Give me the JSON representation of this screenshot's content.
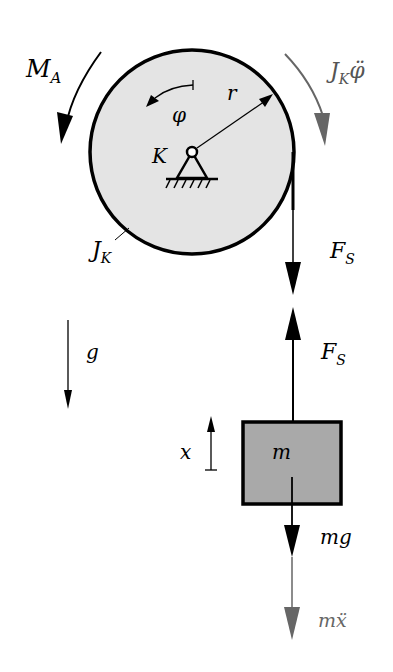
{
  "diagram": {
    "type": "free-body diagram",
    "colors": {
      "disk_fill": "#e4e4e4",
      "block_fill": "#a9a9a9",
      "stroke": "#000000",
      "inertia_arrow": "#666666"
    },
    "labels": {
      "moment": "M",
      "moment_sub": "A",
      "inertia_moment": "J",
      "inertia_moment_sub": "K",
      "inertia_moment_suffix": "φ̈",
      "angle": "φ",
      "radius": "r",
      "pivot": "K",
      "disk_inertia": "J",
      "disk_inertia_sub": "K",
      "rope_force_top": "F",
      "rope_force_top_sub": "S",
      "rope_force_bottom": "F",
      "rope_force_bottom_sub": "S",
      "gravity": "g",
      "coordinate": "x",
      "mass": "m",
      "weight": "mg",
      "inertia_force": "mẍ"
    }
  }
}
